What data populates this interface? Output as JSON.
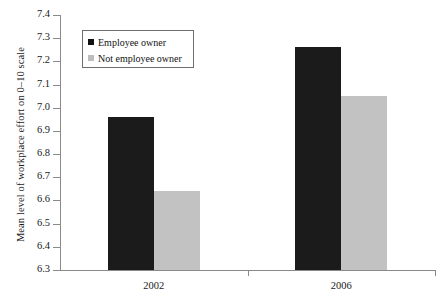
{
  "chart_data": {
    "type": "bar",
    "title": "",
    "subtitle": "",
    "xlabel": "",
    "ylabel": "Mean level of workplace effort on 0–10 scale",
    "categories": [
      "2002",
      "2006"
    ],
    "series": [
      {
        "name": "Employee owner",
        "values": [
          6.96,
          7.26
        ],
        "color": "#1b1b1b"
      },
      {
        "name": "Not employee owner",
        "values": [
          6.64,
          7.05
        ],
        "color": "#c2c2c2"
      }
    ],
    "ylim": [
      6.3,
      7.4
    ],
    "ytick_step": 0.1,
    "ytick_labels": [
      "7.4",
      "7.3",
      "7.2",
      "7.1",
      "7.0",
      "6.9",
      "6.8",
      "6.7",
      "6.6",
      "6.5",
      "6.4",
      "6.3"
    ],
    "grid": false,
    "legend_position": "upper-left-inside",
    "legend_entries": [
      "Employee owner",
      "Not employee owner"
    ],
    "annotations": []
  },
  "axis": {
    "y_title": "Mean level of workplace effort on 0–10 scale"
  },
  "legend": {
    "entry_0": "Employee owner",
    "entry_1": "Not employee owner"
  },
  "ticks": {
    "y_0": "7.4",
    "y_1": "7.3",
    "y_2": "7.2",
    "y_3": "7.1",
    "y_4": "7.0",
    "y_5": "6.9",
    "y_6": "6.8",
    "y_7": "6.7",
    "y_8": "6.6",
    "y_9": "6.5",
    "y_10": "6.4",
    "y_11": "6.3",
    "x_0": "2002",
    "x_1": "2006"
  }
}
